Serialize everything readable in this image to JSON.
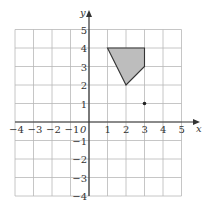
{
  "diagram": {
    "type": "coordinate-grid",
    "x_axis_label": "x",
    "y_axis_label": "y",
    "origin_label": "0",
    "x_range": [
      -4,
      5
    ],
    "y_range": [
      -4,
      5
    ],
    "x_ticks": [
      "−4",
      "−3",
      "−2",
      "−1",
      "1",
      "2",
      "3",
      "4",
      "5"
    ],
    "y_ticks": [
      "5",
      "4",
      "3",
      "2",
      "1",
      "−1",
      "−2",
      "−3",
      "−4"
    ],
    "shape": {
      "vertices": [
        [
          1,
          4
        ],
        [
          3,
          4
        ],
        [
          3,
          3
        ],
        [
          2,
          2
        ]
      ],
      "fill": "#bdbdbd",
      "stroke": "#333333"
    },
    "point": {
      "x": 3,
      "y": 1,
      "color": "#222222"
    }
  }
}
